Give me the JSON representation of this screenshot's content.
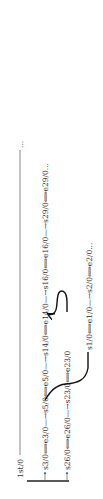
{
  "diagram": {
    "orientation": "rotated-90-ccw",
    "root": {
      "label": "1st/0",
      "continuation": "..."
    },
    "rows": [
      {
        "id": "row-1",
        "nodes": [
          {
            "start": "s3/0",
            "end": "e3/0"
          },
          {
            "start": "s5/0",
            "end": "e5/0"
          },
          {
            "start": "s14/0",
            "end": "e14/0"
          },
          {
            "start": "s16/0",
            "end": "e16/0"
          },
          {
            "start": "s29/0",
            "end": "e29/0..."
          }
        ]
      },
      {
        "id": "row-2",
        "nodes": [
          {
            "start": "s26/0",
            "end": "e26/0"
          },
          {
            "start": "s23/0",
            "end": "e23/0"
          }
        ]
      },
      {
        "id": "row-3",
        "nodes": [
          {
            "start": "s1/0",
            "end": "e1/0"
          },
          {
            "start": "s2/0",
            "end": "e2/0..."
          }
        ]
      }
    ],
    "cross_links": [
      {
        "from": "e3/0",
        "to": "s1/0"
      },
      {
        "from": "e23/0",
        "to": "s14/0"
      }
    ],
    "connector_double_arrow": "⟺",
    "colors": {
      "text": "#333333",
      "line": "#555555",
      "curve": "#111111"
    }
  }
}
